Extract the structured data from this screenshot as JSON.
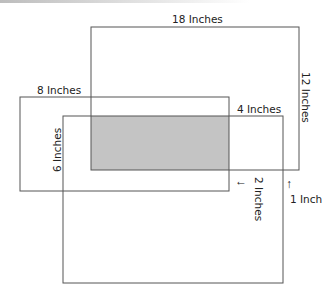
{
  "diagram": {
    "shaded_color": "#c4c4c4",
    "line_color": "#555555",
    "labels": {
      "top_width": "18 Inches",
      "right_height": "12 Inches",
      "left_width": "8 Inches",
      "inner_width": "4 Inches",
      "left_height": "6 Inches",
      "gap_a": "2 Inches",
      "gap_b": "1 Inch"
    },
    "arrows": {
      "gap_a": "←",
      "gap_b": "↑"
    }
  }
}
